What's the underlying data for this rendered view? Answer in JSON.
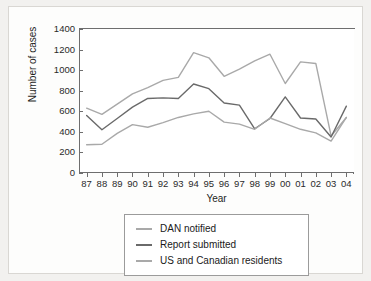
{
  "chart_data": {
    "type": "line",
    "title": "",
    "xlabel": "Year",
    "ylabel": "Number of cases",
    "categories": [
      "87",
      "88",
      "89",
      "90",
      "91",
      "92",
      "93",
      "94",
      "95",
      "96",
      "97",
      "98",
      "99",
      "00",
      "01",
      "02",
      "03",
      "04"
    ],
    "yticks": [
      0,
      200,
      400,
      600,
      800,
      1000,
      1200,
      1400
    ],
    "ylim": [
      0,
      1400
    ],
    "grid": false,
    "legend_position": "below-axes",
    "series": [
      {
        "name": "DAN notified",
        "color": "#a9a9a9",
        "values": [
          630,
          570,
          670,
          770,
          830,
          900,
          930,
          1170,
          1120,
          940,
          1010,
          1090,
          1155,
          870,
          1080,
          1065,
          360,
          540
        ]
      },
      {
        "name": "Report submitted",
        "color": "#6a6a6a",
        "values": [
          560,
          420,
          530,
          640,
          725,
          730,
          725,
          865,
          820,
          680,
          660,
          430,
          530,
          740,
          535,
          525,
          350,
          650
        ]
      },
      {
        "name": "US and Canadian residents",
        "color": "#a9a9a9",
        "values": [
          275,
          280,
          385,
          470,
          445,
          490,
          540,
          575,
          600,
          495,
          475,
          425,
          535,
          480,
          425,
          390,
          310,
          540
        ]
      }
    ]
  },
  "axis": {
    "ylabel": "Number of cases",
    "xlabel": "Year"
  },
  "legend": {
    "items": [
      {
        "label": "DAN notified"
      },
      {
        "label": "Report submitted"
      },
      {
        "label": "US and Canadian residents"
      }
    ]
  }
}
